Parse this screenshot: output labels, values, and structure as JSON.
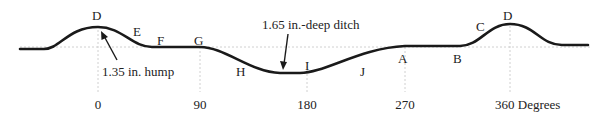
{
  "diagram": {
    "colors": {
      "curve": "#1a1a1a",
      "guide": "#b5b5b5",
      "text": "#222222"
    },
    "points": {
      "D_left": "D",
      "E": "E",
      "F": "F",
      "G": "G",
      "H": "H",
      "I": "I",
      "J": "J",
      "A": "A",
      "B": "B",
      "C": "C",
      "D_right": "D"
    },
    "annotations": {
      "hump": "1.35 in. hump",
      "ditch": "1.65 in.-deep ditch"
    },
    "axis": {
      "ticks": [
        "0",
        "90",
        "180",
        "270",
        "360 Degrees"
      ]
    }
  }
}
